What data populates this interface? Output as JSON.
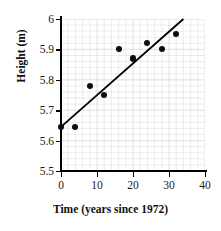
{
  "chart_data": {
    "type": "scatter",
    "title": "",
    "xlabel": "Time (years since 1972)",
    "ylabel": "Height (m)",
    "xlim": [
      0,
      40
    ],
    "ylim": [
      5.5,
      6.0
    ],
    "xticks": [
      0,
      10,
      20,
      30,
      40
    ],
    "yticks": [
      5.5,
      5.6,
      5.7,
      5.8,
      5.9,
      6
    ],
    "xticklabels": [
      "0",
      "10",
      "20",
      "30",
      "40"
    ],
    "yticklabels": [
      "5.5",
      "5.6",
      "5.7",
      "5.8",
      "5.9",
      "6"
    ],
    "grid": true,
    "grid_color": "#dcdcdc",
    "grid_minor_x_step": 2,
    "grid_minor_y_step": 0.02,
    "legend": null,
    "marker_color": "#0d0d0d",
    "line_color": "#000000",
    "points": [
      {
        "x": 0,
        "y": 5.645
      },
      {
        "x": 4,
        "y": 5.645
      },
      {
        "x": 8,
        "y": 5.78
      },
      {
        "x": 12,
        "y": 5.75
      },
      {
        "x": 16,
        "y": 5.9
      },
      {
        "x": 20,
        "y": 5.87
      },
      {
        "x": 24,
        "y": 5.92
      },
      {
        "x": 28,
        "y": 5.9
      },
      {
        "x": 32,
        "y": 5.95
      }
    ],
    "x": [
      0,
      4,
      8,
      12,
      16,
      20,
      24,
      28,
      32
    ],
    "values": [
      5.645,
      5.645,
      5.78,
      5.75,
      5.9,
      5.87,
      5.92,
      5.9,
      5.95
    ],
    "trendline": {
      "x_start": 0,
      "y_start": 5.645,
      "x_end": 34,
      "y_end": 6.0
    }
  }
}
